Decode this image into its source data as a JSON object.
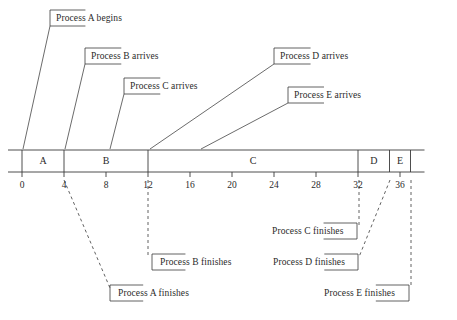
{
  "figure": {
    "type": "gantt-timeline",
    "stroke_color": "#3a3a3a",
    "text_color": "#2a2a2a",
    "background": "#ffffff"
  },
  "axis": {
    "origin_value": 0,
    "end_value": 36,
    "px_per_unit": 10.5,
    "origin_px": 22,
    "baseline_y": 172,
    "bar_top_y": 150,
    "ticks": [
      {
        "label": "0",
        "value": 0
      },
      {
        "label": "4",
        "value": 4
      },
      {
        "label": "8",
        "value": 8
      },
      {
        "label": "12",
        "value": 12
      },
      {
        "label": "16",
        "value": 16
      },
      {
        "label": "20",
        "value": 20
      },
      {
        "label": "24",
        "value": 24
      },
      {
        "label": "28",
        "value": 28
      },
      {
        "label": "32",
        "value": 32
      },
      {
        "label": "36",
        "value": 36
      }
    ]
  },
  "segments": [
    {
      "label": "A",
      "start": 0,
      "end": 4
    },
    {
      "label": "B",
      "start": 4,
      "end": 12
    },
    {
      "label": "C",
      "start": 12,
      "end": 32
    },
    {
      "label": "D",
      "start": 32,
      "end": 35
    },
    {
      "label": "E",
      "start": 35,
      "end": 37
    }
  ],
  "annotations_above": [
    {
      "text": "Process A begins",
      "bracket_x": 50,
      "bracket_y": 18,
      "text_x": 56,
      "text_y": 13,
      "leader_to_x": 23,
      "leader_to_y": 149
    },
    {
      "text": "Process B arrives",
      "bracket_x": 85,
      "bracket_y": 56,
      "text_x": 91,
      "text_y": 51,
      "leader_to_x": 65,
      "leader_to_y": 149
    },
    {
      "text": "Process C arrives",
      "bracket_x": 124,
      "bracket_y": 86,
      "text_x": 130,
      "text_y": 81,
      "leader_to_x": 110,
      "leader_to_y": 149
    },
    {
      "text": "Process D arrives",
      "bracket_x": 274,
      "bracket_y": 56,
      "text_x": 280,
      "text_y": 51,
      "leader_to_x": 150,
      "leader_to_y": 149
    },
    {
      "text": "Process E arrives",
      "bracket_x": 288,
      "bracket_y": 95,
      "text_x": 294,
      "text_y": 90,
      "leader_to_x": 201,
      "leader_to_y": 149
    }
  ],
  "annotations_below": [
    {
      "text": "Process A finishes",
      "side": "right",
      "bracket_x": 110,
      "bracket_y": 293,
      "text_x": 118,
      "text_y": 288
    },
    {
      "text": "Process B finishes",
      "side": "right",
      "bracket_x": 152,
      "bracket_y": 262,
      "text_x": 160,
      "text_y": 257
    },
    {
      "text": "Process C finishes",
      "side": "left",
      "bracket_x": 357,
      "bracket_y": 231,
      "text_x": 272,
      "text_y": 226
    },
    {
      "text": "Process D finishes",
      "side": "left",
      "bracket_x": 358,
      "bracket_y": 262,
      "text_x": 273,
      "text_y": 257
    },
    {
      "text": "Process E finishes",
      "side": "left",
      "bracket_x": 409,
      "bracket_y": 293,
      "text_x": 324,
      "text_y": 288
    }
  ],
  "dropline_paths": [
    {
      "name": "a-finish-drop",
      "points": "64,180 110,288"
    },
    {
      "name": "b-finish-drop",
      "points": "148,180 148,257"
    },
    {
      "name": "c-finish-drop",
      "points": "359,180 359,226"
    },
    {
      "name": "d-finish-drop",
      "points": "390,180 359,257"
    },
    {
      "name": "e-finish-drop",
      "points": "411,180 411,288"
    }
  ]
}
